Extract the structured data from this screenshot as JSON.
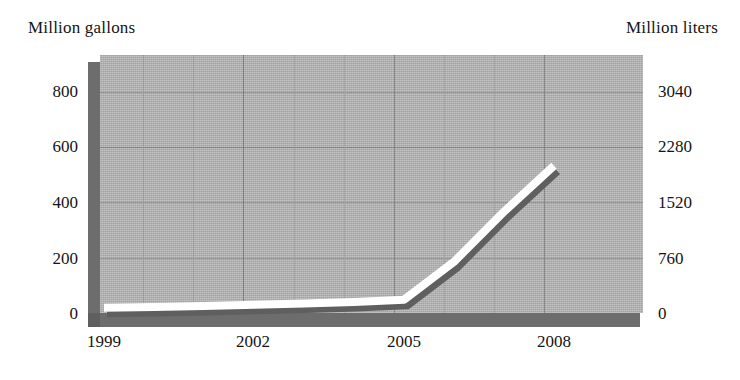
{
  "chart_data": {
    "type": "line",
    "title": "",
    "xlabel": "",
    "ylabel": "Million gallons",
    "y2label": "Million liters",
    "categories": [
      "1999",
      "2000",
      "2001",
      "2002",
      "2003",
      "2004",
      "2005",
      "2006",
      "2007",
      "2008"
    ],
    "x": [
      1999,
      2000,
      2001,
      2002,
      2003,
      2004,
      2005,
      2006,
      2007,
      2008
    ],
    "series": [
      {
        "name": "Production",
        "units": "million gallons",
        "values": [
          30,
          34,
          38,
          44,
          50,
          58,
          68,
          250,
          490,
          710
        ]
      }
    ],
    "xtick_labels": [
      "1999",
      "2002",
      "2005",
      "2008"
    ],
    "xtick_values": [
      1999,
      2002,
      2005,
      2008
    ],
    "ylim": [
      0,
      900
    ],
    "ytick_labels": [
      "0",
      "200",
      "400",
      "600",
      "800"
    ],
    "ytick_values": [
      0,
      200,
      400,
      600,
      800
    ],
    "y2lim": [
      0,
      3420
    ],
    "y2tick_labels": [
      "0",
      "760",
      "1520",
      "2280",
      "3040"
    ],
    "y2tick_values": [
      0,
      760,
      1520,
      2280,
      3040
    ],
    "conversion_factor": 3.8,
    "grid": true,
    "legend": "none",
    "style": "3d-ribbon-line-on-grey-panel",
    "colors": {
      "panel": "#b4b4b4",
      "wall": "#6d6d6d",
      "gridline": "#8a8a8a",
      "gridline_major": "#7c7c7c",
      "line": "#ffffff",
      "line_shadow": "#5f5f5f",
      "text": "#141414",
      "background": "#ffffff"
    }
  },
  "axes": {
    "left_caption": "Million gallons",
    "right_caption": "Million liters"
  },
  "ticks": {
    "left": [
      {
        "label": "800",
        "y": 92
      },
      {
        "label": "600",
        "y": 147
      },
      {
        "label": "400",
        "y": 203
      },
      {
        "label": "200",
        "y": 259
      },
      {
        "label": "0",
        "y": 314
      }
    ],
    "right": [
      {
        "label": "3040",
        "y": 92
      },
      {
        "label": "2280",
        "y": 147
      },
      {
        "label": "1520",
        "y": 203
      },
      {
        "label": "760",
        "y": 259
      },
      {
        "label": "0",
        "y": 314
      }
    ],
    "x": [
      {
        "label": "1999",
        "x": 104
      },
      {
        "label": "2002",
        "x": 253
      },
      {
        "label": "2005",
        "x": 404
      },
      {
        "label": "2008",
        "x": 554
      }
    ]
  },
  "gridlines": {
    "horizontal_y": [
      37,
      92,
      147,
      203,
      259
    ],
    "vertical_x": [
      143,
      193,
      243,
      294,
      344,
      394,
      444,
      494,
      544
    ],
    "vertical_major_x": [
      243,
      394,
      544
    ]
  }
}
